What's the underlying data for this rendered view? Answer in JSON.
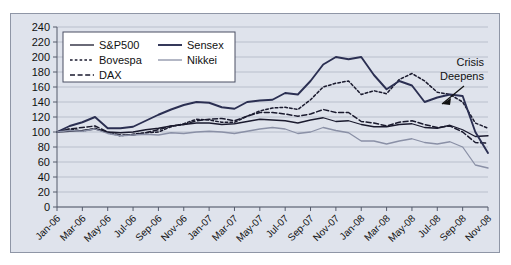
{
  "chart_data": {
    "type": "line",
    "title": "",
    "xlabel": "",
    "ylabel": "",
    "ylim": [
      0,
      240
    ],
    "ytick_step": 20,
    "yticks": [
      0,
      20,
      40,
      60,
      80,
      100,
      120,
      140,
      160,
      180,
      200,
      220,
      240
    ],
    "grid": true,
    "legend_position": "top-left-inside",
    "note": "Indexed stock market performance, Jan-06 = 100",
    "x": [
      "Jan-06",
      "Feb-06",
      "Mar-06",
      "Apr-06",
      "May-06",
      "Jun-06",
      "Jul-06",
      "Aug-06",
      "Sep-06",
      "Oct-06",
      "Nov-06",
      "Dec-06",
      "Jan-07",
      "Feb-07",
      "Mar-07",
      "Apr-07",
      "May-07",
      "Jun-07",
      "Jul-07",
      "Aug-07",
      "Sep-07",
      "Oct-07",
      "Nov-07",
      "Dec-07",
      "Jan-08",
      "Feb-08",
      "Mar-08",
      "Apr-08",
      "May-08",
      "Jun-08",
      "Jul-08",
      "Aug-08",
      "Sep-08",
      "Oct-08",
      "Nov-08"
    ],
    "xtick_labels": [
      "Jan-06",
      "Mar-06",
      "May-06",
      "Jul-06",
      "Sep-06",
      "Nov-06",
      "Jan-07",
      "Mar-07",
      "May-07",
      "Jul-07",
      "Sep-07",
      "Nov-07",
      "Jan-08",
      "Mar-08",
      "May-08",
      "Jul-08",
      "Sep-08",
      "Nov-08"
    ],
    "series": [
      {
        "name": "S&P500",
        "style": "solid-thin",
        "color": "#1a1a2e",
        "values": [
          100,
          101,
          102,
          104,
          100,
          99,
          100,
          103,
          105,
          108,
          110,
          112,
          112,
          110,
          111,
          114,
          117,
          116,
          115,
          112,
          116,
          119,
          114,
          115,
          110,
          107,
          107,
          110,
          111,
          106,
          105,
          109,
          103,
          94,
          95
        ]
      },
      {
        "name": "Bovespa",
        "style": "dotted",
        "color": "#1a1a2e",
        "values": [
          100,
          104,
          101,
          105,
          99,
          95,
          97,
          99,
          100,
          107,
          111,
          117,
          116,
          113,
          113,
          121,
          128,
          132,
          133,
          130,
          143,
          160,
          165,
          168,
          150,
          155,
          151,
          170,
          178,
          168,
          153,
          150,
          140,
          112,
          105
        ]
      },
      {
        "name": "DAX",
        "style": "dashed",
        "color": "#1a1a2e",
        "values": [
          100,
          104,
          106,
          108,
          100,
          96,
          96,
          99,
          103,
          108,
          110,
          115,
          117,
          118,
          115,
          121,
          126,
          126,
          124,
          121,
          124,
          130,
          126,
          126,
          114,
          112,
          108,
          113,
          115,
          110,
          106,
          108,
          100,
          86,
          85
        ]
      },
      {
        "name": "Sensex",
        "style": "solid-thick",
        "color": "#2b2f52",
        "values": [
          100,
          108,
          113,
          120,
          105,
          105,
          107,
          115,
          123,
          130,
          136,
          140,
          139,
          133,
          131,
          140,
          142,
          143,
          152,
          150,
          168,
          190,
          200,
          197,
          200,
          176,
          157,
          168,
          162,
          140,
          146,
          150,
          148,
          100,
          72
        ]
      },
      {
        "name": "Nikkei",
        "style": "solid-gray",
        "color": "#8a90a6",
        "values": [
          100,
          102,
          101,
          104,
          98,
          95,
          96,
          97,
          96,
          99,
          98,
          100,
          101,
          100,
          98,
          101,
          104,
          106,
          104,
          98,
          100,
          106,
          102,
          99,
          88,
          88,
          84,
          88,
          91,
          86,
          84,
          87,
          80,
          56,
          52
        ]
      }
    ],
    "annotations": [
      {
        "text_line1": "Crisis",
        "text_line2": "Deepens",
        "arrow": "points-down-left"
      }
    ]
  },
  "legend": {
    "entries": [
      {
        "label": "S&P500"
      },
      {
        "label": "Sensex"
      },
      {
        "label": "Bovespa"
      },
      {
        "label": "Nikkei"
      },
      {
        "label": "DAX"
      }
    ]
  }
}
